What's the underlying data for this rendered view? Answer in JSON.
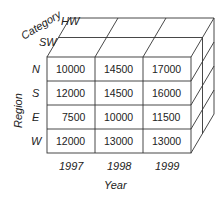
{
  "diagram": {
    "type": "data-cube",
    "axes": {
      "category": {
        "label": "Category",
        "values": [
          "HW",
          "SW"
        ]
      },
      "region": {
        "label": "Region",
        "values": [
          "N",
          "S",
          "E",
          "W"
        ]
      },
      "year": {
        "label": "Year",
        "values": [
          "1997",
          "1998",
          "1999"
        ]
      }
    },
    "front_face": {
      "rows": [
        {
          "region": "N",
          "cells": [
            "10000",
            "14500",
            "17000"
          ]
        },
        {
          "region": "S",
          "cells": [
            "12000",
            "14500",
            "16000"
          ]
        },
        {
          "region": "E",
          "cells": [
            "7500",
            "10000",
            "11500"
          ]
        },
        {
          "region": "W",
          "cells": [
            "12000",
            "13000",
            "13000"
          ]
        }
      ]
    },
    "colors": {
      "line": "#333333",
      "text": "#222222",
      "background": "#ffffff"
    }
  }
}
